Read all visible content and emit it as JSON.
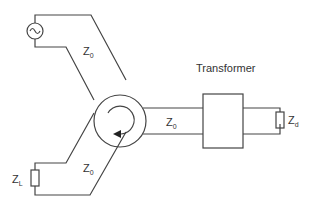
{
  "diagram": {
    "labels": {
      "transformer": "Transformer",
      "z0_top": {
        "main": "Z",
        "sub": "0"
      },
      "z0_right": {
        "main": "Z",
        "sub": "0"
      },
      "z0_bottom": {
        "main": "Z",
        "sub": "0"
      },
      "zd": {
        "main": "Z",
        "sub": "d"
      },
      "zl": {
        "main": "Z",
        "sub": "L"
      }
    },
    "components": {
      "source": "ac-source",
      "circulator": "circulator",
      "transformer": "transformer",
      "load_d": "resistor",
      "load_l": "resistor"
    },
    "colors": {
      "line": "#444444",
      "text": "#333333",
      "background": "#ffffff"
    }
  }
}
